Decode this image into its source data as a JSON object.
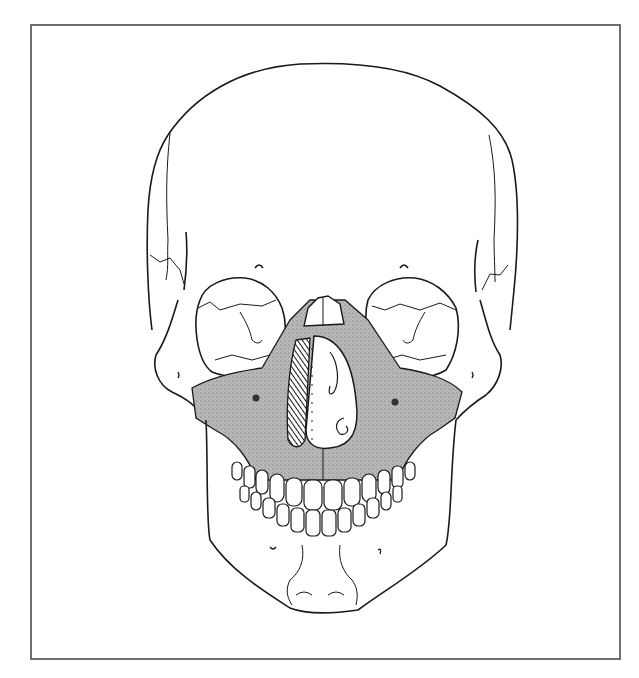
{
  "figure": {
    "caption": "",
    "frame_color": "#6e6e6e",
    "line_color": "#1a1a1a",
    "shade_color": "#b4b4b4",
    "shade_dark": "#5a5a5a"
  },
  "regions": {
    "cranium": "Frontal bone / cranial vault",
    "orbit_left": "Left orbit",
    "orbit_right": "Right orbit",
    "nasal_bones": "Nasal bones",
    "nasal_aperture": "Nasal cavity / septum",
    "maxilla": "Maxilla (shaded)",
    "zygomatic_left": "Left zygomatic bone",
    "zygomatic_right": "Right zygomatic bone",
    "upper_teeth": "Maxillary teeth",
    "lower_teeth": "Mandibular teeth",
    "mandible": "Mandible",
    "mental_protuberance": "Mental protuberance"
  }
}
